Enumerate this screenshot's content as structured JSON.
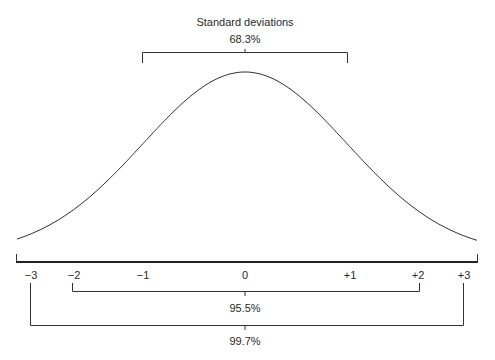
{
  "title": "Standard deviations",
  "brackets": [
    {
      "label": "68.3%",
      "from": -1,
      "to": 1
    },
    {
      "label": "95.5%",
      "from": -2,
      "to": 2
    },
    {
      "label": "99.7%",
      "from": -3,
      "to": 3
    }
  ],
  "axis": {
    "ticks": [
      {
        "value": -3,
        "label": "−3"
      },
      {
        "value": -2,
        "label": "−2"
      },
      {
        "value": -1,
        "label": "−1"
      },
      {
        "value": 0,
        "label": "0"
      },
      {
        "value": 1,
        "label": "+1"
      },
      {
        "value": 2,
        "label": "+2"
      },
      {
        "value": 3,
        "label": "+3"
      }
    ]
  },
  "chart_data": {
    "type": "line",
    "title": "Standard deviations",
    "xlabel": "",
    "ylabel": "",
    "x": [
      -3,
      -2,
      -1,
      0,
      1,
      2,
      3
    ],
    "series": [
      {
        "name": "Normal distribution",
        "values": [
          0.0044,
          0.054,
          0.242,
          0.399,
          0.242,
          0.054,
          0.0044
        ]
      }
    ],
    "annotations": [
      "68.3% within ±1",
      "95.5% within ±2",
      "99.7% within ±3"
    ],
    "grid": false
  }
}
